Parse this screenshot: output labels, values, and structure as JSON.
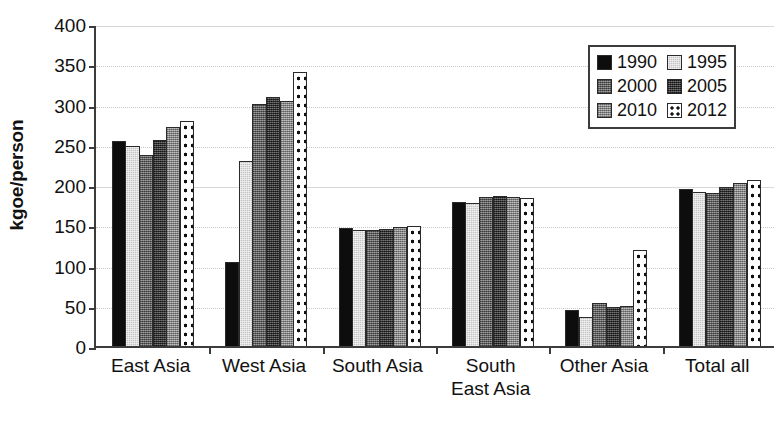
{
  "chart_data": {
    "type": "bar",
    "title": "",
    "xlabel": "",
    "ylabel": "kgoe/person",
    "ylim": [
      0,
      400
    ],
    "ytick_step": 50,
    "yticks": [
      0,
      50,
      100,
      150,
      200,
      250,
      300,
      350,
      400
    ],
    "ytick_labels": [
      "0",
      "50",
      "100",
      "150",
      "200",
      "250",
      "300",
      "350",
      "400"
    ],
    "grid": true,
    "legend_position": "top-right",
    "categories": [
      "East Asia",
      "West Asia",
      "South Asia",
      "South East Asia",
      "Other Asia",
      "Total all"
    ],
    "category_lines": [
      [
        "East Asia"
      ],
      [
        "West Asia"
      ],
      [
        "South Asia"
      ],
      [
        "South",
        "East Asia"
      ],
      [
        "Other Asia"
      ],
      [
        "Total all"
      ]
    ],
    "series": [
      {
        "name": "1990",
        "color": "#0d0d0d",
        "pattern": "solid-black",
        "values": [
          255,
          104,
          146,
          179,
          45,
          195
        ]
      },
      {
        "name": "1995",
        "color": "#c4c4c4",
        "pattern": "light-gray",
        "values": [
          248,
          230,
          144,
          178,
          36,
          191
        ]
      },
      {
        "name": "2000",
        "color": "#6e6e6e",
        "pattern": "mid-crosshatch",
        "values": [
          237,
          301,
          144,
          185,
          54,
          190
        ]
      },
      {
        "name": "2005",
        "color": "#3f3f3f",
        "pattern": "dark-crosshatch",
        "values": [
          256,
          309,
          145,
          186,
          49,
          197
        ]
      },
      {
        "name": "2010",
        "color": "#8e8e8e",
        "pattern": "gray-weave",
        "values": [
          272,
          304,
          148,
          185,
          50,
          203
        ]
      },
      {
        "name": "2012",
        "color": "#ffffff",
        "pattern": "white-dots",
        "values": [
          279,
          341,
          149,
          184,
          119,
          206
        ]
      }
    ]
  },
  "legend": {
    "entries": [
      {
        "label": "1990"
      },
      {
        "label": "1995"
      },
      {
        "label": "2000"
      },
      {
        "label": "2005"
      },
      {
        "label": "2010"
      },
      {
        "label": "2012"
      }
    ]
  },
  "colors": {
    "axis": "#3c3c3c",
    "grid": "#c8c8c8",
    "text": "#111111",
    "background": "#ffffff"
  }
}
